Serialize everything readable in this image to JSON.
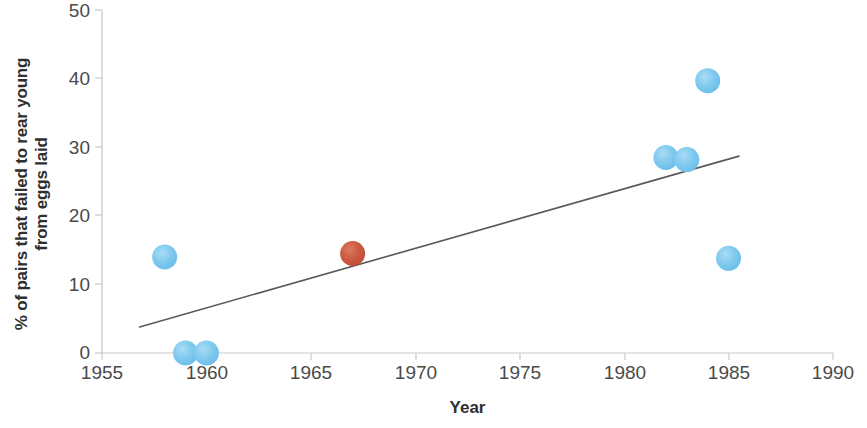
{
  "chart_data": {
    "type": "scatter",
    "title": "",
    "xlabel": "Year",
    "ylabel": "% of  pairs that failed to rear young\nfrom eggs laid",
    "xlim": [
      1955,
      1990
    ],
    "ylim": [
      0,
      50
    ],
    "xticks": [
      1955,
      1960,
      1965,
      1970,
      1975,
      1980,
      1985,
      1990
    ],
    "yticks": [
      0,
      10,
      20,
      30,
      40,
      50
    ],
    "grid": false,
    "legend": "none",
    "series": [
      {
        "name": "Breeding failure (observed)",
        "marker": "circle",
        "color": "#7FC9EE",
        "points": [
          {
            "x": 1958,
            "y": 14.0
          },
          {
            "x": 1959,
            "y": 0.0
          },
          {
            "x": 1960,
            "y": 0.0
          },
          {
            "x": 1982,
            "y": 28.5
          },
          {
            "x": 1983,
            "y": 28.2
          },
          {
            "x": 1984,
            "y": 39.7
          },
          {
            "x": 1985,
            "y": 13.8
          }
        ]
      },
      {
        "name": "Highlighted point",
        "marker": "circle",
        "color": "#CB5A41",
        "points": [
          {
            "x": 1967,
            "y": 14.5
          }
        ]
      }
    ],
    "trendline": {
      "type": "linear",
      "color": "#595959",
      "x_start": 1956.8,
      "y_start": 3.8,
      "x_end": 1985.5,
      "y_end": 28.7
    }
  },
  "axis": {
    "x_tick_labels": [
      "1955",
      "1960",
      "1965",
      "1970",
      "1975",
      "1980",
      "1985",
      "1990"
    ],
    "y_tick_labels": [
      "0",
      "10",
      "20",
      "30",
      "40",
      "50"
    ],
    "x_title": "Year",
    "y_title": "% of  pairs that failed to rear young\nfrom eggs laid"
  }
}
